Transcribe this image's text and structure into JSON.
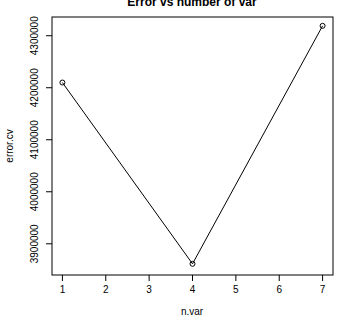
{
  "chart_data": {
    "type": "line",
    "title": "Error vs number of var",
    "xlabel": "n.var",
    "ylabel": "error.cv",
    "x": [
      1,
      4,
      7
    ],
    "series": [
      {
        "name": "error.cv",
        "values": [
          4210000,
          3861500,
          4319000
        ]
      }
    ],
    "xticks": [
      "1",
      "2",
      "3",
      "4",
      "5",
      "6",
      "7"
    ],
    "yticks": [
      "3900000",
      "4000000",
      "4100000",
      "4200000",
      "4300000"
    ],
    "xlim": [
      0.76,
      7.24
    ],
    "ylim": [
      3840000,
      4336000
    ],
    "grid": false,
    "legend": null,
    "markers": "open-circle"
  }
}
